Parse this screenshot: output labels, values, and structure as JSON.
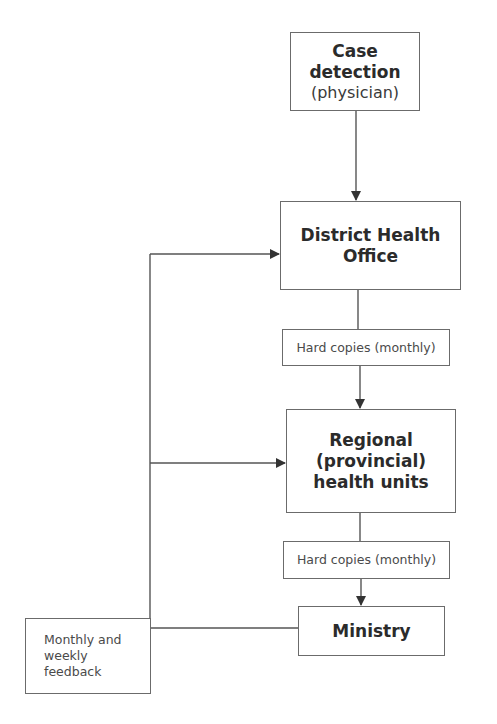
{
  "diagram": {
    "nodes": [
      {
        "id": "case-detection",
        "title": "Case detection",
        "subtitle": "(physician)"
      },
      {
        "id": "district-health-office",
        "title_line1": "District Health",
        "title_line2": "Office"
      },
      {
        "id": "hard-copies-1",
        "label": "Hard copies (monthly)"
      },
      {
        "id": "regional-health-units",
        "title_line1": "Regional",
        "title_line2": "(provincial)",
        "title_line3": "health units"
      },
      {
        "id": "hard-copies-2",
        "label": "Hard copies (monthly)"
      },
      {
        "id": "ministry",
        "title": "Ministry"
      },
      {
        "id": "feedback",
        "line1": "Monthly and",
        "line2": "weekly",
        "line3": "feedback"
      }
    ],
    "edges": [
      {
        "from": "case-detection",
        "to": "district-health-office",
        "type": "arrow"
      },
      {
        "from": "district-health-office",
        "to": "hard-copies-1",
        "type": "line"
      },
      {
        "from": "hard-copies-1",
        "to": "regional-health-units",
        "type": "arrow"
      },
      {
        "from": "regional-health-units",
        "to": "hard-copies-2",
        "type": "line"
      },
      {
        "from": "hard-copies-2",
        "to": "ministry",
        "type": "arrow"
      },
      {
        "from": "ministry",
        "to": "feedback",
        "type": "line"
      },
      {
        "from": "feedback",
        "to": "district-health-office",
        "type": "arrow"
      },
      {
        "from": "feedback",
        "to": "regional-health-units",
        "type": "arrow"
      }
    ],
    "colors": {
      "line": "#555555",
      "border": "#6b6b6b",
      "text": "#2b2b2b"
    }
  }
}
